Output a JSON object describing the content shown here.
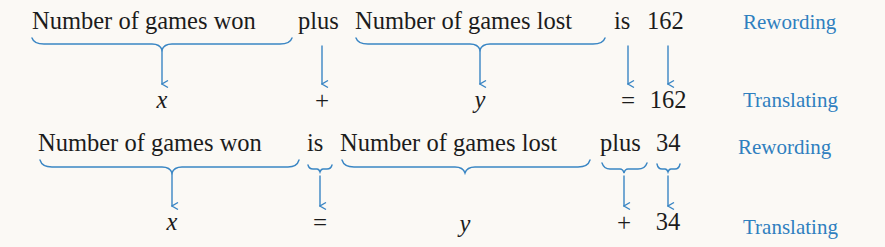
{
  "accent_color": "#2f7fbf",
  "text_color": "#1c1c1c",
  "rows": [
    {
      "rewording": {
        "phrases": [
          "Number of games won",
          "plus",
          "Number of games lost",
          "is",
          "162"
        ],
        "label": "Rewording"
      },
      "translating": {
        "terms": [
          "x",
          "+",
          "y",
          "=",
          "162"
        ],
        "label": "Translating"
      }
    },
    {
      "rewording": {
        "phrases": [
          "Number of games won",
          "is",
          "Number of games lost",
          "plus",
          "34"
        ],
        "label": "Rewording"
      },
      "translating": {
        "terms": [
          "x",
          "=",
          "y",
          "+",
          "34"
        ],
        "label": "Translating"
      }
    }
  ]
}
